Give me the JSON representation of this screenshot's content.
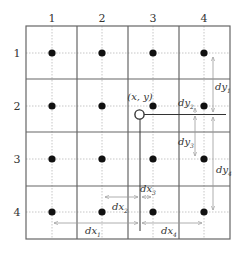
{
  "diagram": {
    "column_labels": [
      "1",
      "2",
      "3",
      "4"
    ],
    "row_labels": [
      "1",
      "2",
      "3",
      "4"
    ],
    "point_label": "(x, y)",
    "dy_labels": [
      {
        "base": "dy",
        "sub": "1"
      },
      {
        "base": "dy",
        "sub": "2"
      },
      {
        "base": "dy",
        "sub": "3"
      },
      {
        "base": "dy",
        "sub": "4"
      }
    ],
    "dx_labels": [
      {
        "base": "dx",
        "sub": "1"
      },
      {
        "base": "dx",
        "sub": "2"
      },
      {
        "base": "dx",
        "sub": "3"
      },
      {
        "base": "dx",
        "sub": "4"
      }
    ],
    "colors": {
      "grid": "#555555",
      "guide": "#b0b0b0",
      "dot": "#111111",
      "arrow": "#999999",
      "line": "#333333"
    }
  }
}
